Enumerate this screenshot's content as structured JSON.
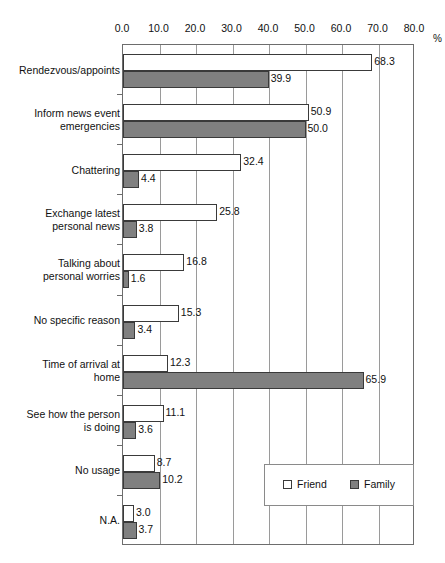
{
  "chart_data": {
    "type": "bar",
    "orientation": "horizontal",
    "title": "",
    "xlabel": "%",
    "ylabel": "",
    "xlim": [
      0.0,
      80.0
    ],
    "xticks": [
      "0.0",
      "10.0",
      "20.0",
      "30.0",
      "40.0",
      "50.0",
      "60.0",
      "70.0",
      "80.0"
    ],
    "grid": true,
    "legend_position": "bottom-right",
    "categories": [
      "Rendezvous/appoints",
      "Inform news event\nemergencies",
      "Chattering",
      "Exchange latest\npersonal news",
      "Talking about\npersonal worries",
      "No specific reason",
      "Time of arrival at\nhome",
      "See how the person\nis doing",
      "No usage",
      "N.A."
    ],
    "series": [
      {
        "name": "Friend",
        "color": "#ffffff",
        "values": [
          68.3,
          50.9,
          32.4,
          25.8,
          16.8,
          15.3,
          12.3,
          11.1,
          8.7,
          3.0
        ],
        "labels": [
          "68.3",
          "50.9",
          "32.4",
          "25.8",
          "16.8",
          "15.3",
          "12.3",
          "11.1",
          "8.7",
          "3.0"
        ]
      },
      {
        "name": "Family",
        "color": "#808080",
        "values": [
          39.9,
          50.0,
          4.4,
          3.8,
          1.6,
          3.4,
          65.9,
          3.6,
          10.2,
          3.7
        ],
        "labels": [
          "39.9",
          "50.0",
          "4.4",
          "3.8",
          "1.6",
          "3.4",
          "65.9",
          "3.6",
          "10.2",
          "3.7"
        ]
      }
    ]
  }
}
